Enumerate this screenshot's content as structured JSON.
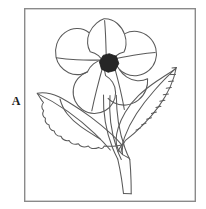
{
  "figure": {
    "label": "A",
    "caption": "",
    "title": "",
    "background_color": "#ffffff",
    "ink_color": "#5a5a5a",
    "dark_fill_color": "#262626",
    "frame": {
      "x": 24,
      "y": 8,
      "width": 172,
      "height": 194,
      "stroke_color": "#8a8a8a",
      "stroke_width": 1.4,
      "fill_color": "#ffffff"
    }
  },
  "subject": {
    "name": "flower-plant-line-drawing",
    "parts": [
      {
        "name": "petal-top",
        "kind": "petal",
        "index": 1,
        "center": [
          103,
          37
        ]
      },
      {
        "name": "petal-upper-left",
        "kind": "petal",
        "index": 2,
        "center": [
          78,
          51
        ]
      },
      {
        "name": "petal-upper-right",
        "kind": "petal",
        "index": 3,
        "center": [
          133,
          53
        ]
      },
      {
        "name": "petal-lower-left",
        "kind": "petal",
        "index": 4,
        "center": [
          85,
          83
        ]
      },
      {
        "name": "petal-lower-right",
        "kind": "petal",
        "index": 5,
        "center": [
          121,
          85
        ]
      },
      {
        "name": "flower-center",
        "kind": "disc",
        "center": [
          109,
          63
        ],
        "radius": 9,
        "fill": "#262626"
      },
      {
        "name": "leaf-left",
        "kind": "leaf",
        "tip": [
          37,
          93
        ],
        "base": [
          120,
          145
        ]
      },
      {
        "name": "leaf-right",
        "kind": "leaf",
        "tip": [
          176,
          68
        ],
        "base": [
          124,
          150
        ]
      },
      {
        "name": "stem-main",
        "kind": "stem",
        "from": [
          121,
          150
        ],
        "to": [
          130,
          193
        ]
      },
      {
        "name": "stem-flower",
        "kind": "stem",
        "from": [
          109,
          95
        ],
        "to": [
          121,
          150
        ]
      }
    ],
    "petal_count": 5,
    "leaf_count": 2
  }
}
